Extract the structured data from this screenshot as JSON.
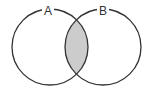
{
  "diagram": {
    "type": "venn",
    "sets": [
      {
        "label": "A",
        "cx": 50,
        "cy": 47,
        "r": 38
      },
      {
        "label": "B",
        "cx": 103,
        "cy": 47,
        "r": 38
      }
    ],
    "shaded_region": "A ∩ B",
    "shade_color": "#cccccc",
    "stroke_color": "#333333"
  }
}
